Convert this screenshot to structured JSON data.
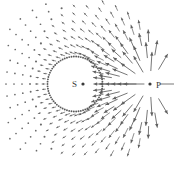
{
  "figure": {
    "background_color": "#ffffff",
    "width": 174,
    "height": 171,
    "arrow_color": "#5f5f5f",
    "dot_color": "#6a6a6a",
    "ring_color": "#5a5a5a",
    "label_color": "#3a3a3a"
  },
  "points": {
    "source": {
      "label": "S",
      "label_x": 72,
      "label_y": 87,
      "marker_x": 83,
      "marker_y": 84,
      "marker_r": 1.6
    },
    "focus": {
      "label": "P",
      "label_x": 156,
      "label_y": 88,
      "marker_x": 150,
      "marker_y": 84,
      "marker_r": 1.6
    }
  },
  "inner_ring": {
    "center_x": 75,
    "center_y": 84,
    "radius": 27.5,
    "dot_count": 74,
    "dot_r": 0.95
  },
  "chart_data": {
    "type": "scatter",
    "center": {
      "x": 75,
      "y": 84,
      "label": "S"
    },
    "focus": {
      "x": 150,
      "y": 84,
      "label": "P"
    },
    "grid": {
      "angular_divisions": 36,
      "angle_start_deg": 0,
      "angle_step_deg": 10,
      "radial_rings": [
        30,
        37,
        45,
        53,
        61,
        69,
        77,
        85
      ],
      "ring_count": 8
    },
    "vector_rule": {
      "direction": "away-from-P",
      "length_model": "scaled by inverse distance to P",
      "min_length_px": 1.2,
      "max_length_px": 22,
      "arrowhead": true
    },
    "xlabel": "",
    "ylabel": "",
    "legend": []
  },
  "caption": {
    "text": "",
    "visible_fragment": ""
  }
}
